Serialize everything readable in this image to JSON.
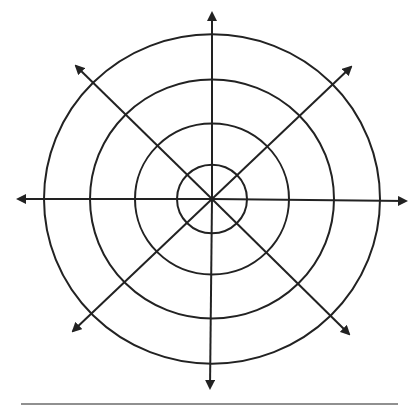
{
  "diagram": {
    "type": "polar-grid",
    "center": [
      212,
      199
    ],
    "ring_radii": [
      35,
      77,
      122,
      168
    ],
    "axes": [
      {
        "name": "up",
        "end": [
          212,
          13
        ]
      },
      {
        "name": "down",
        "end": [
          210,
          388
        ]
      },
      {
        "name": "left",
        "end": [
          18,
          199
        ]
      },
      {
        "name": "right",
        "end": [
          406,
          201
        ]
      },
      {
        "name": "up-left",
        "end": [
          76,
          66
        ]
      },
      {
        "name": "up-right",
        "end": [
          351,
          67
        ]
      },
      {
        "name": "down-left",
        "end": [
          73,
          331
        ]
      },
      {
        "name": "down-right",
        "end": [
          349,
          334
        ]
      }
    ],
    "stroke_color": "#222222",
    "baseline": {
      "x1": 21,
      "x2": 398,
      "y": 404
    }
  }
}
